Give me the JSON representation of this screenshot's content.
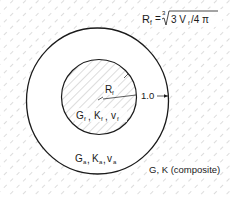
{
  "diagram": {
    "formula": {
      "lhs": "R",
      "lhs_sub": "f",
      "eq": "=",
      "root_index": "3",
      "radicand_a": "3 V",
      "radicand_sub": "f",
      "radicand_b": " /4 π"
    },
    "inner": {
      "radius_label": "R",
      "radius_sub": "f",
      "props": [
        "G",
        "K",
        "v"
      ],
      "props_sub": "f"
    },
    "outer_radius_label": "1.0",
    "matrix": {
      "props": [
        "G",
        "K",
        "v"
      ],
      "props_sub": "a"
    },
    "composite": {
      "label": "G, K (composite)"
    },
    "colors": {
      "line": "#1a1a1a",
      "hatch": "#9a9a9a",
      "background": "#ffffff"
    }
  }
}
